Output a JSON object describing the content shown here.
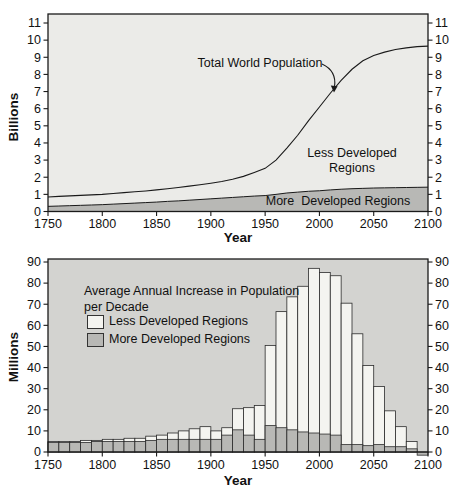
{
  "colors": {
    "page_background": "#ffffff",
    "top_plot_background": "#ebebe8",
    "bottom_plot_background": "#d3d3d0",
    "more_developed_fill": "#b8b8b5",
    "less_developed_bar_fill": "#f4f4f0",
    "line_and_frame": "#1a1a1a",
    "text": "#111111"
  },
  "chart_data": [
    {
      "id": "world-population-area-chart",
      "type": "area",
      "xlabel": "Year",
      "ylabel": "Billions",
      "xlim": [
        1750,
        2100
      ],
      "ylim": [
        0,
        11
      ],
      "xticks": [
        1750,
        1800,
        1850,
        1900,
        1950,
        2000,
        2050,
        2100
      ],
      "yticks": [
        0,
        1,
        2,
        3,
        4,
        5,
        6,
        7,
        8,
        9,
        10,
        11
      ],
      "x": [
        1750,
        1760,
        1770,
        1780,
        1790,
        1800,
        1810,
        1820,
        1830,
        1840,
        1850,
        1860,
        1870,
        1880,
        1890,
        1900,
        1910,
        1920,
        1930,
        1940,
        1950,
        1960,
        1970,
        1980,
        1990,
        2000,
        2010,
        2020,
        2030,
        2040,
        2050,
        2060,
        2070,
        2080,
        2090,
        2100
      ],
      "series": [
        {
          "name": "Total World Population",
          "style": "line",
          "values": [
            0.85,
            0.88,
            0.91,
            0.94,
            0.97,
            1.0,
            1.05,
            1.1,
            1.15,
            1.2,
            1.26,
            1.33,
            1.4,
            1.48,
            1.56,
            1.65,
            1.75,
            1.88,
            2.05,
            2.28,
            2.52,
            3.0,
            3.7,
            4.45,
            5.3,
            6.1,
            6.9,
            7.65,
            8.3,
            8.8,
            9.1,
            9.3,
            9.45,
            9.55,
            9.62,
            9.65
          ]
        },
        {
          "name": "More Developed Regions",
          "style": "area",
          "values": [
            0.3,
            0.32,
            0.34,
            0.36,
            0.38,
            0.4,
            0.43,
            0.46,
            0.49,
            0.52,
            0.55,
            0.59,
            0.62,
            0.66,
            0.7,
            0.74,
            0.78,
            0.82,
            0.86,
            0.9,
            0.93,
            1.0,
            1.08,
            1.13,
            1.18,
            1.21,
            1.26,
            1.3,
            1.33,
            1.35,
            1.37,
            1.38,
            1.39,
            1.4,
            1.41,
            1.42
          ]
        }
      ],
      "annotations": {
        "total_label": "Total World Population",
        "less_label": "Less Developed\nRegions",
        "more_label": "More  Developed Regions"
      }
    },
    {
      "id": "population-increase-bar-chart",
      "type": "bar",
      "title": "Average Annual Increase in Population\nper Decade",
      "xlabel": "Year",
      "ylabel": "Millions",
      "xlim": [
        1750,
        2100
      ],
      "ylim": [
        0,
        90
      ],
      "xticks": [
        1750,
        1800,
        1850,
        1900,
        1950,
        2000,
        2050,
        2100
      ],
      "yticks": [
        0,
        10,
        20,
        30,
        40,
        50,
        60,
        70,
        80,
        90
      ],
      "bar_width_years": 10,
      "decade_start_years": [
        1750,
        1760,
        1770,
        1780,
        1790,
        1800,
        1810,
        1820,
        1830,
        1840,
        1850,
        1860,
        1870,
        1880,
        1890,
        1900,
        1910,
        1920,
        1930,
        1940,
        1950,
        1960,
        1970,
        1980,
        1990,
        2000,
        2010,
        2020,
        2030,
        2040,
        2050,
        2060,
        2070,
        2080,
        2090
      ],
      "legend_position": "top-left",
      "series": [
        {
          "name": "Less Developed Regions",
          "color": "#f4f4f0",
          "values": [
            5,
            5,
            5,
            5.5,
            5.5,
            6,
            6,
            6.5,
            6.5,
            7.5,
            8,
            9,
            10,
            11,
            12,
            10,
            11.5,
            20.5,
            21,
            22,
            50.5,
            66.5,
            73.5,
            78.5,
            87,
            85,
            83.5,
            70.5,
            56,
            41,
            31,
            19.5,
            12,
            5,
            0
          ]
        },
        {
          "name": "More Developed Regions",
          "color": "#b8b8b5",
          "values": [
            4.5,
            4.5,
            4.5,
            4.5,
            5,
            5,
            5,
            5,
            5,
            5.5,
            6,
            6,
            6,
            6,
            6,
            6,
            8,
            10.5,
            8,
            6,
            12.5,
            11.5,
            10.5,
            9.5,
            9,
            8.5,
            8,
            3.5,
            3.5,
            3,
            3.5,
            2.5,
            2.5,
            1.5,
            -1.5
          ]
        }
      ]
    }
  ]
}
